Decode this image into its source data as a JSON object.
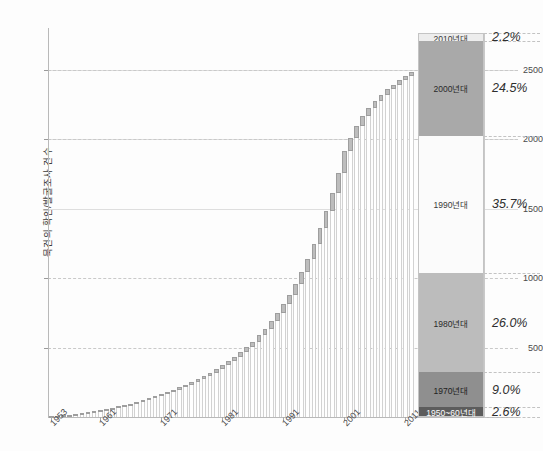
{
  "chart_data": {
    "type": "bar",
    "title": "",
    "subtitle": "",
    "xlabel": "",
    "ylabel": "묵건의 확인/발굴조사 건수",
    "ylim": [
      0,
      2800
    ],
    "xlim": [
      1953,
      2013
    ],
    "grid": true,
    "legend_position": "none",
    "note": "Cumulative count of discovery/excavation surveys per year, with annual increment shown as the darker cap atop each bar; right-hand stacked bar breaks the total down by decade.",
    "y_ticks": [
      {
        "value": 500,
        "label": "500"
      },
      {
        "value": 1000,
        "label": "1000"
      },
      {
        "value": 1500,
        "label": "1500"
      },
      {
        "value": 2000,
        "label": "2000"
      },
      {
        "value": 2500,
        "label": "2500"
      }
    ],
    "x_ticks": [
      {
        "value": 1953,
        "label": "1953"
      },
      {
        "value": 1961,
        "label": "1961"
      },
      {
        "value": 1971,
        "label": "1971"
      },
      {
        "value": 1981,
        "label": "1981"
      },
      {
        "value": 1991,
        "label": "1991"
      },
      {
        "value": 2001,
        "label": "2001"
      },
      {
        "value": 2011,
        "label": "2011"
      }
    ],
    "x": [
      1953,
      1954,
      1955,
      1956,
      1957,
      1958,
      1959,
      1960,
      1961,
      1962,
      1963,
      1964,
      1965,
      1966,
      1967,
      1968,
      1969,
      1970,
      1971,
      1972,
      1973,
      1974,
      1975,
      1976,
      1977,
      1978,
      1979,
      1980,
      1981,
      1982,
      1983,
      1984,
      1985,
      1986,
      1987,
      1988,
      1989,
      1990,
      1991,
      1992,
      1993,
      1994,
      1995,
      1996,
      1997,
      1998,
      1999,
      2000,
      2001,
      2002,
      2003,
      2004,
      2005,
      2006,
      2007,
      2008,
      2009,
      2010,
      2011,
      2012
    ],
    "cumulative": [
      4,
      8,
      12,
      17,
      22,
      28,
      34,
      41,
      49,
      57,
      66,
      76,
      86,
      97,
      109,
      121,
      134,
      148,
      163,
      179,
      196,
      214,
      233,
      253,
      274,
      296,
      320,
      345,
      372,
      401,
      432,
      466,
      503,
      543,
      587,
      635,
      688,
      746,
      810,
      881,
      959,
      1045,
      1140,
      1244,
      1357,
      1480,
      1613,
      1757,
      1912,
      2010,
      2094,
      2165,
      2225,
      2276,
      2320,
      2358,
      2392,
      2423,
      2452,
      2480
    ],
    "annual_increment": [
      4,
      4,
      4,
      5,
      5,
      6,
      6,
      7,
      8,
      8,
      9,
      10,
      10,
      11,
      12,
      12,
      13,
      14,
      15,
      16,
      17,
      18,
      19,
      20,
      21,
      22,
      24,
      25,
      27,
      29,
      31,
      34,
      37,
      40,
      44,
      48,
      53,
      58,
      64,
      71,
      78,
      86,
      95,
      104,
      113,
      123,
      133,
      144,
      155,
      98,
      84,
      71,
      60,
      51,
      44,
      38,
      34,
      31,
      29,
      28
    ],
    "series": [
      {
        "name": "누적 건수",
        "type": "bar-stem",
        "color": "#ffffff"
      },
      {
        "name": "연간 증가분",
        "type": "bar-cap",
        "color": "#bdbdbd"
      }
    ],
    "decade_breakdown": {
      "label": "연대별 구성비",
      "segments": [
        {
          "decade": "2010년대",
          "percent": 2.2,
          "percent_label": "2.2%",
          "color": "#ededed",
          "text_color": "#3a3a3a"
        },
        {
          "decade": "2000년대",
          "percent": 24.5,
          "percent_label": "24.5%",
          "color": "#a9a9a9",
          "text_color": "#2a2a2a"
        },
        {
          "decade": "1990년대",
          "percent": 35.7,
          "percent_label": "35.7%",
          "color": "#fbfbfb",
          "text_color": "#3a3a3a"
        },
        {
          "decade": "1980년대",
          "percent": 26.0,
          "percent_label": "26.0%",
          "color": "#bcbcbc",
          "text_color": "#2a2a2a"
        },
        {
          "decade": "1970년대",
          "percent": 9.0,
          "percent_label": "9.0%",
          "color": "#8f8f8f",
          "text_color": "#1e1e1e"
        },
        {
          "decade": "1950~60년대",
          "percent": 2.6,
          "percent_label": "2.6%",
          "color": "#5c5c5c",
          "text_color": "#ffffff"
        }
      ]
    }
  }
}
